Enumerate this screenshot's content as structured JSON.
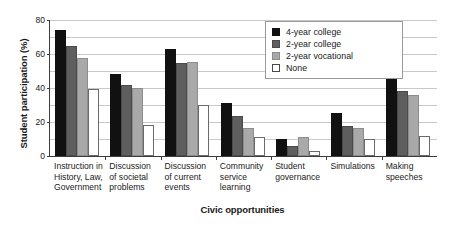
{
  "chart_data": {
    "type": "bar",
    "title": "",
    "xlabel": "Civic opportunities",
    "ylabel": "Student participation (%)",
    "ylim": [
      0,
      80
    ],
    "yticks": [
      0,
      20,
      40,
      60,
      80
    ],
    "ytick_labels": [
      "0",
      "20",
      "40",
      "60",
      "80"
    ],
    "gridlines": [
      10,
      20,
      30,
      40,
      50,
      60,
      70,
      80
    ],
    "grid": true,
    "legend_position": "top-right",
    "categories": [
      "Instruction in\nHistory, Law,\nGovernment",
      "Discussion\nof societal\nproblems",
      "Discussion\nof current\nevents",
      "Community\nservice\nlearning",
      "Student\ngovernance",
      "Simulations",
      "Making\nspeeches"
    ],
    "series": [
      {
        "name": "4-year college",
        "color": "#111111",
        "values": [
          74,
          48.5,
          63,
          31,
          10,
          25.5,
          50
        ]
      },
      {
        "name": "2-year college",
        "color": "#5e5e5e",
        "values": [
          64.5,
          41.5,
          55,
          23.5,
          6,
          17.5,
          38
        ]
      },
      {
        "name": "2-year vocational",
        "color": "#a9a9a9",
        "values": [
          57.5,
          40,
          55.5,
          16.5,
          11,
          16.5,
          36
        ]
      },
      {
        "name": "None",
        "color": "#ffffff",
        "values": [
          39.5,
          18,
          30,
          11,
          3,
          10,
          11.5
        ]
      }
    ]
  }
}
